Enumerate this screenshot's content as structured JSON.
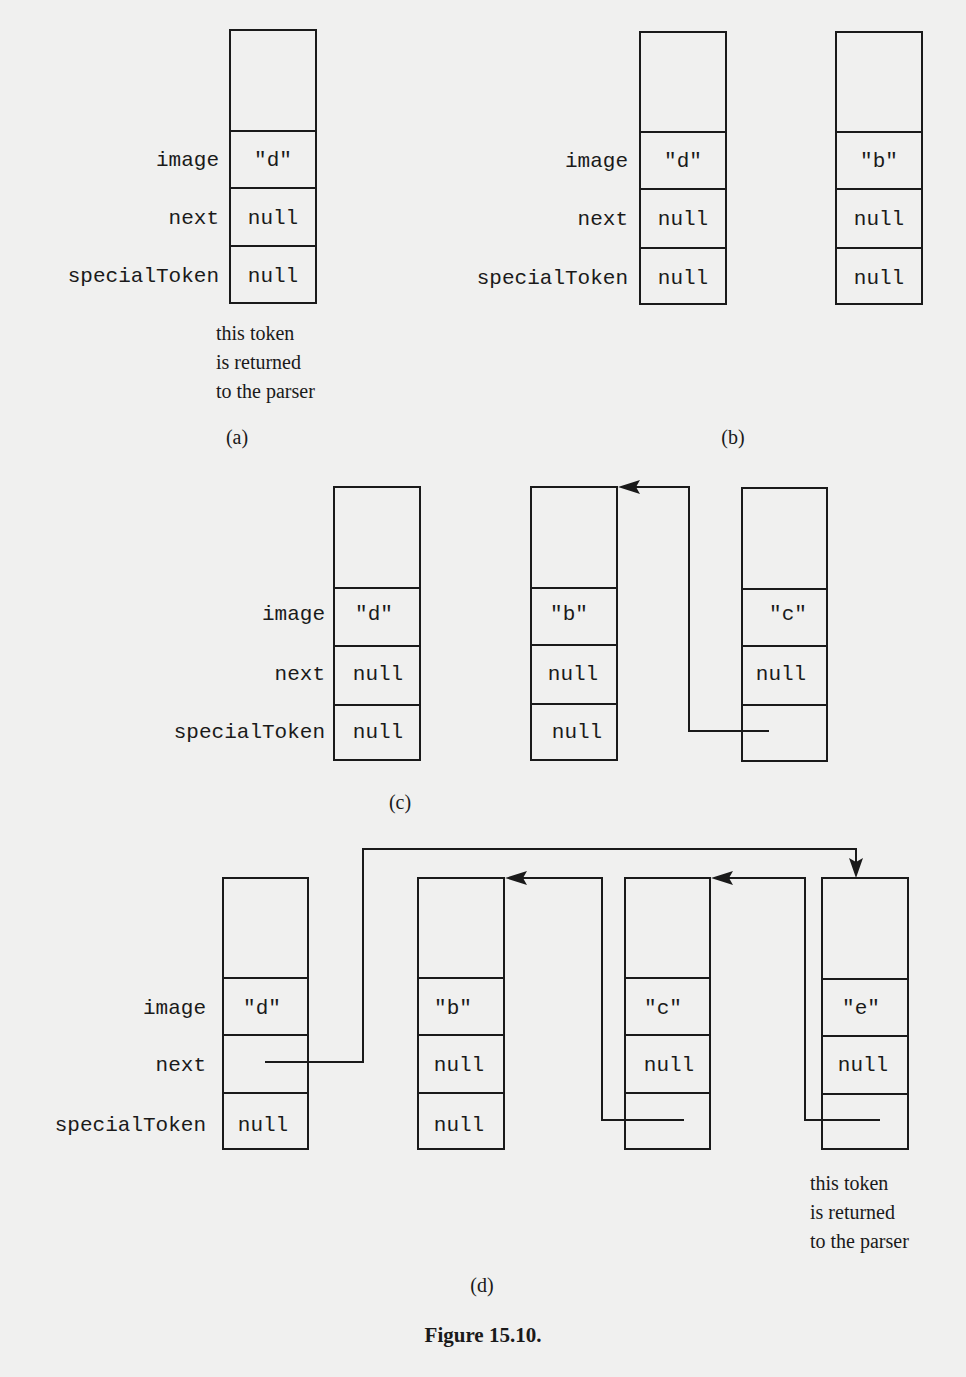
{
  "figure": {
    "title": "Figure 15.10.",
    "field_labels": {
      "image": "image",
      "next": "next",
      "specialToken": "specialToken"
    },
    "note": {
      "line1": "this token",
      "line2": "is returned",
      "line3": "to the parser"
    },
    "panels": {
      "a": {
        "caption": "(a)",
        "tokens": [
          {
            "image": "\"d\"",
            "next": "null",
            "specialToken": "null"
          }
        ],
        "note_shown": true
      },
      "b": {
        "caption": "(b)",
        "tokens": [
          {
            "image": "\"d\"",
            "next": "null",
            "specialToken": "null"
          },
          {
            "image": "\"b\"",
            "next": "null",
            "specialToken": "null"
          }
        ]
      },
      "c": {
        "caption": "(c)",
        "tokens": [
          {
            "image": "\"d\"",
            "next": "null",
            "specialToken": "null"
          },
          {
            "image": "\"b\"",
            "next": "null",
            "specialToken": "null"
          },
          {
            "image": "\"c\"",
            "next": "null",
            "specialToken": ""
          }
        ],
        "links": [
          {
            "from": "c.specialToken",
            "to": "b"
          }
        ]
      },
      "d": {
        "caption": "(d)",
        "tokens": [
          {
            "image": "\"d\"",
            "next": "",
            "specialToken": "null"
          },
          {
            "image": "\"b\"",
            "next": "null",
            "specialToken": "null"
          },
          {
            "image": "\"c\"",
            "next": "null",
            "specialToken": ""
          },
          {
            "image": "\"e\"",
            "next": "null",
            "specialToken": ""
          }
        ],
        "links": [
          {
            "from": "d.next",
            "to": "e"
          },
          {
            "from": "c.specialToken",
            "to": "b"
          },
          {
            "from": "e.specialToken",
            "to": "c"
          }
        ],
        "note_shown": true
      }
    }
  }
}
